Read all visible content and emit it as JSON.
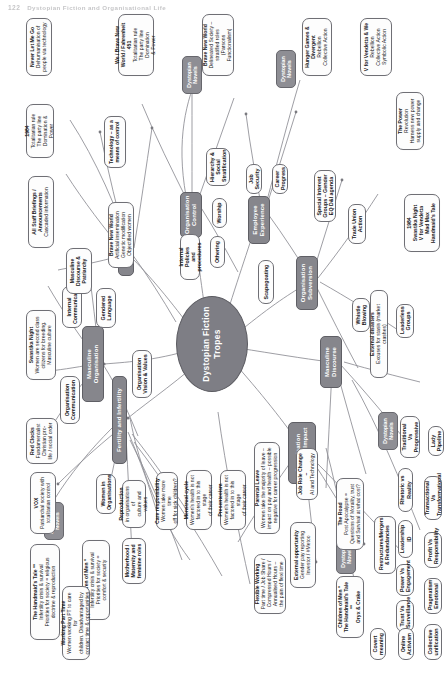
{
  "page_header": {
    "number": "122",
    "title": "Dystopian Fiction and Organisational Life"
  },
  "diagram": {
    "type": "mind-map",
    "orientation": "rotated-90-ccw",
    "center": {
      "label": "Dystopian Fiction\nTropes"
    },
    "branches": [
      {
        "label": "Fertility and Infertility"
      },
      {
        "label": "Masculine Organisation"
      },
      {
        "label": "Culture"
      },
      {
        "label": "Organisation Control"
      },
      {
        "label": "Employee Experience"
      },
      {
        "label": "Organisation Subversion"
      },
      {
        "label": "Masculine Discourse"
      },
      {
        "label": "Organisation Change & Impact"
      }
    ],
    "chips": [
      {
        "label": "Dystopian Novels"
      },
      {
        "label": "Dystopian Novels"
      },
      {
        "label": "Dystopian Novels"
      },
      {
        "label": "Dystopian Novels"
      },
      {
        "label": "Dystopian Novels"
      }
    ],
    "mid_nodes": [
      {
        "label": "Organisation\nCommunication"
      },
      {
        "label": "Organisation\nVision & Values"
      },
      {
        "label": "Gendered\nLanguage"
      },
      {
        "label": "Internal\nCommunication"
      },
      {
        "label": "Women in\nOrganisations"
      },
      {
        "label": "Internal Policies\nand procedures"
      },
      {
        "label": "Othering"
      },
      {
        "label": "Worship"
      },
      {
        "label": "Hierarchy &\nSocial\nStratification"
      },
      {
        "label": "Job\nSecurity"
      },
      {
        "label": "Career\nProgress"
      },
      {
        "label": "Scapegoating"
      },
      {
        "label": "Special Interest\nGroups – Gender\nEQ D&I agenda"
      },
      {
        "label": "Trade Union\nAction"
      },
      {
        "label": "Whistle\nBlowing"
      },
      {
        "label": "Leaderless\nGroups"
      },
      {
        "label": "Traditional Vs\nProgressive"
      },
      {
        "label": "Rhetoric vs Reality"
      },
      {
        "label": "Leadership ID"
      },
      {
        "label": "Power Vs\nEngagement"
      },
      {
        "label": "Trust Vs\nSurveillance"
      },
      {
        "label": "Lady\nPipeline"
      },
      {
        "label": "Transactional Vs\nTransformational"
      },
      {
        "label": "Profit Vs\nResponsibility"
      },
      {
        "label": "Pragmatism\nEmotional"
      },
      {
        "label": "Collective\nunification"
      },
      {
        "label": "Online\nActivism"
      },
      {
        "label": "Covert\nmeaning"
      }
    ],
    "leaves": [
      {
        "title": "The Handmaid's Tale **",
        "body": "Infertility crisis & survival\nPriorities for society = religious\ndoctrine & reproduction"
      },
      {
        "title": "VOX",
        "body": "Patriarchal society with\ntotalitarian control"
      },
      {
        "title": "Red Clocks",
        "body": "Fundamentalist\nChristian pro-\nlife / social order"
      },
      {
        "title": "Swastika Night",
        "body": "Women are second class\ncitizens for breeding.\nMasculine culture"
      },
      {
        "title": "Children of Men *",
        "body": "Infertility crisis & survival\nPriorities for society =\ncomfort & security"
      },
      {
        "title": "Motherhood /\nMaternity and\nfeminine roles",
        "body": ""
      },
      {
        "title": "Reproduction",
        "body": "in organisations of\nculture and values"
      },
      {
        "title": "Care responsibility",
        "body": "Women take more time\noff for sick children?"
      },
      {
        "title": "Menstrual cycle",
        "body": "Women's health is not\nfactored in to this stage\nof their career"
      },
      {
        "title": "Presenteeism",
        "body": "Women's health is not\nfactored in to this stage\nof their career"
      },
      {
        "title": "Parental Leave",
        "body": "Women take the majority of leave –\nimpact on pay and health – possible\nnegative for career progression"
      },
      {
        "title": "Flexible Working",
        "body": "Part time / Job Share /\nCompressed Hours /\nAnnualised Hours –\nthe pain of flexi time"
      },
      {
        "title": "Working Part Time",
        "body": "Women working PT to care for\nchildren. Disadvantaged by\ncontact time & opportunities"
      },
      {
        "title": "All Staff Briefings /\nAnnouncements",
        "body": "Cascaded information"
      },
      {
        "title": "Masculine\nDiscourse &\nPatriarchy",
        "body": ""
      },
      {
        "title": "1984",
        "body": "Totalitarian rule\nThe party line\nDomination & Power"
      },
      {
        "title": "Never Let Me Go",
        "body": "Dehumanisation of\npeople via technology"
      },
      {
        "title": "We / Brave New\nWorld / Fahrenheit 451",
        "body": "Totalitarian rule\nThe party line Domination\n& Power"
      },
      {
        "title": "Technology – as a\nmeans of control",
        "body": ""
      },
      {
        "title": "Brave New World",
        "body": "Artificial insemination\nGenetic modification\nObjectified women"
      },
      {
        "title": "Brave New World",
        "body": "Delineated Society –\nstratified roles\n(Parsons Functionalism)"
      },
      {
        "title": "Hunger Games &\nDivergent",
        "body": "Rebellion\nCollective Action"
      },
      {
        "title": "V for Vendetta & We",
        "body": "Rebellion\nCollective Action\nSymbolic Action"
      },
      {
        "title": "The Power",
        "body": "Revolution\nHarness new power\nsupply and change"
      },
      {
        "title": "1984\nSwastika Night\nV for Vendetta\nMad Max\nHandmaid's Tale",
        "body": ""
      },
      {
        "title": "The Road",
        "body": "Post Apocalypse =\nQuestions of Morality, trust\nand Survival at what cost?"
      },
      {
        "title": "Children of Men *\nThe Handmaid's Tale **\nOryx & Crake",
        "body": ""
      },
      {
        "title": "External disasters",
        "body": "Excuses for stasis (market crashes)"
      },
      {
        "title": "External opportunity",
        "body": "Gender pay reporting\nInvestor / #Metoo"
      },
      {
        "title": "Job Role Change –",
        "body": "AI and Technology"
      },
      {
        "title": "Restructures/Mergers\n& Redundancies",
        "body": ""
      }
    ]
  }
}
